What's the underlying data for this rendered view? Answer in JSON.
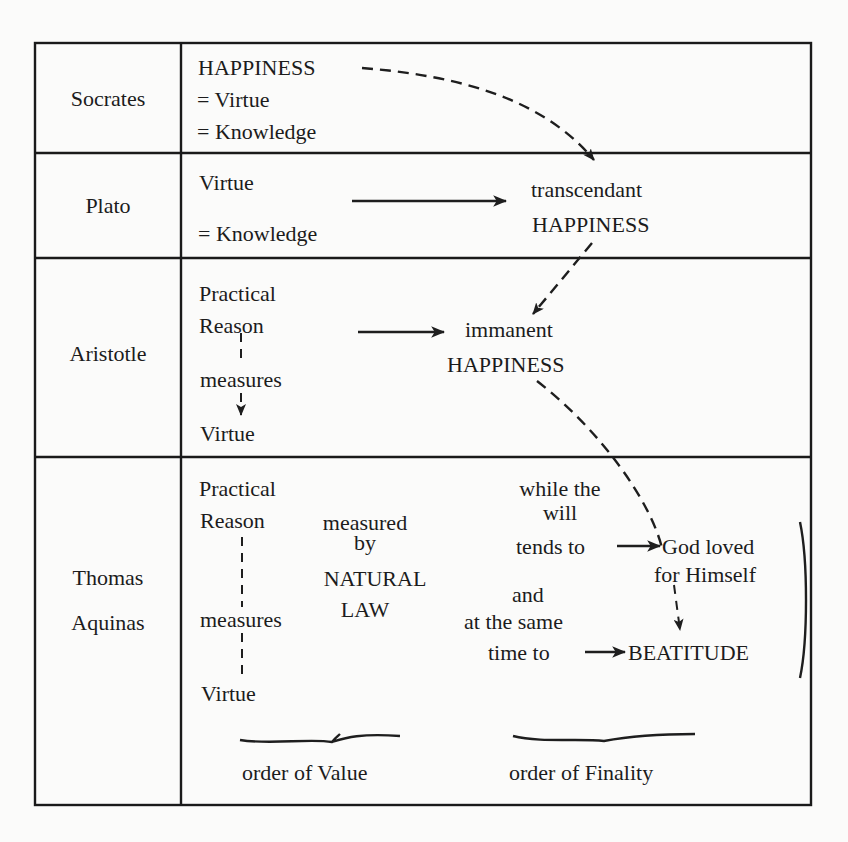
{
  "rows": [
    {
      "philosopher": "Socrates",
      "left_lines": [
        "HAPPINESS",
        "= Virtue",
        "= Knowledge"
      ]
    },
    {
      "philosopher": "Plato",
      "left_lines": [
        "Virtue",
        "= Knowledge"
      ],
      "right_lines": [
        "transcendant",
        "HAPPINESS"
      ]
    },
    {
      "philosopher": "Aristotle",
      "left_lines": [
        "Practical",
        "Reason",
        "measures",
        "Virtue"
      ],
      "right_lines": [
        "immanent",
        "HAPPINESS"
      ]
    },
    {
      "philosopher_lines": [
        "Thomas",
        "Aquinas"
      ],
      "left_lines": [
        "Practical",
        "Reason",
        "measures",
        "Virtue"
      ],
      "middle_lines": [
        "measured",
        "by",
        "NATURAL",
        "LAW"
      ],
      "will_lines": [
        "while  the",
        "will",
        "tends to"
      ],
      "same_time_lines": [
        "and",
        "at the same",
        "time to"
      ],
      "target_lines": [
        "God loved",
        "for Himself"
      ],
      "beatitude": "BEATITUDE"
    }
  ],
  "footer": {
    "order_value": "order of Value",
    "order_finality": "order of Finality"
  },
  "arrows": {
    "solid": [
      {
        "from": "Plato Virtue = Knowledge",
        "to": "transcendant HAPPINESS"
      },
      {
        "from": "Aristotle Practical Reason",
        "to": "immanent HAPPINESS"
      },
      {
        "from": "tends to",
        "to": "God loved for Himself"
      },
      {
        "from": "time to",
        "to": "BEATITUDE"
      }
    ],
    "dashed": [
      {
        "from": "Socrates HAPPINESS",
        "to": "transcendant HAPPINESS"
      },
      {
        "from": "transcendant HAPPINESS",
        "to": "immanent HAPPINESS"
      },
      {
        "from": "immanent HAPPINESS",
        "to": "God loved for Himself"
      },
      {
        "from": "God loved for Himself",
        "to": "BEATITUDE"
      },
      {
        "from": "Practical Reason (Aristotle)",
        "to": "Virtue (Aristotle)",
        "label": "measures"
      },
      {
        "from": "Practical Reason (Aquinas)",
        "to": "Virtue (Aquinas)",
        "label": "measures"
      }
    ]
  },
  "colors": {
    "ink": "#1c1c1c",
    "paper": "#fbfbfa"
  }
}
